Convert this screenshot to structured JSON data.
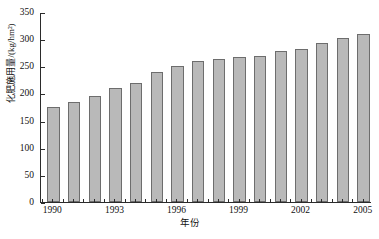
{
  "chart_data": {
    "type": "bar",
    "title": "",
    "subtitle": "",
    "xlabel": "年份",
    "ylabel": "化肥施用量/(kg/hm²)",
    "categories": [
      "1990",
      "1991",
      "1992",
      "1993",
      "1994",
      "1995",
      "1996",
      "1997",
      "1998",
      "1999",
      "2000",
      "2001",
      "2002",
      "2003",
      "2004",
      "2005"
    ],
    "values": [
      175,
      185,
      196,
      210,
      220,
      240,
      250,
      259,
      264,
      267,
      269,
      278,
      282,
      293,
      302,
      310
    ],
    "series": [
      {
        "name": "化肥施用量",
        "values": [
          175,
          185,
          196,
          210,
          220,
          240,
          250,
          259,
          264,
          267,
          269,
          278,
          282,
          293,
          302,
          310
        ]
      }
    ],
    "ylim": [
      0,
      350
    ],
    "yticks": [
      0,
      50,
      100,
      150,
      200,
      250,
      300,
      350
    ],
    "ytick_labels": [
      "0",
      "50",
      "100",
      "150",
      "200",
      "250",
      "300",
      "350"
    ],
    "xtick_labels": [
      "1990",
      "1993",
      "1996",
      "1999",
      "2002",
      "2005"
    ],
    "xtick_categories": [
      "1990",
      "1993",
      "1996",
      "1999",
      "2002",
      "2005"
    ],
    "grid": false,
    "legend": false,
    "legend_position": "none",
    "bar_color": "#b9b9b9",
    "bar_edge_color": "#6d6d6d",
    "axis_color": "#2b2b2b",
    "background_color": "#ffffff",
    "annotations": []
  }
}
